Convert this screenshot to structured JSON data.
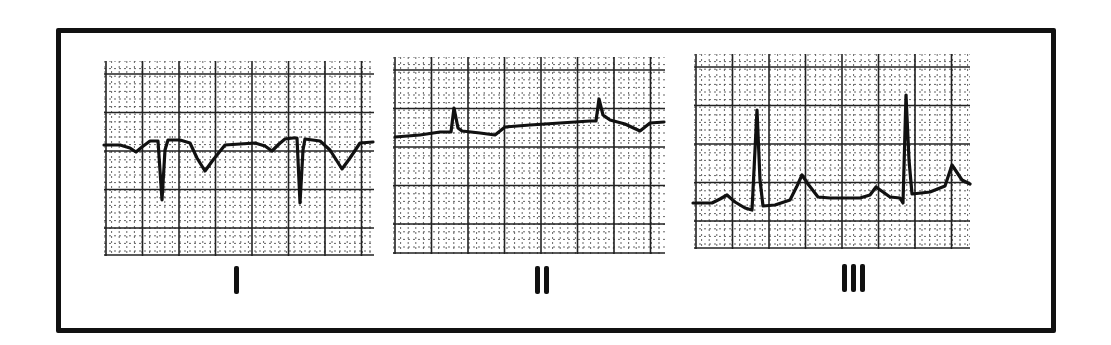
{
  "figure": {
    "type": "ECG strip comparison",
    "panels": [
      {
        "id": "I",
        "label": "I",
        "numeral_strokes": 1,
        "description": "Inverted P, deep negative QRS spikes, inverted T waves"
      },
      {
        "id": "II",
        "label": "II",
        "numeral_strokes": 2,
        "description": "Small positive QRS spikes on near-flat baseline"
      },
      {
        "id": "III",
        "label": "III",
        "numeral_strokes": 3,
        "description": "Upright P, tall positive QRS, upright T waves"
      }
    ]
  },
  "colors": {
    "ink": "#111111",
    "grid_major": "#222222",
    "grid_minor": "#555555",
    "paper": "#ffffff"
  },
  "chart_data": [
    {
      "type": "line",
      "title": "I",
      "xlabel": "",
      "ylabel": "",
      "grid": true,
      "x": [
        104,
        120,
        130,
        136,
        142,
        150,
        158,
        162,
        165,
        168,
        180,
        190,
        197,
        205,
        213,
        225,
        240,
        255,
        265,
        272,
        279,
        285,
        293,
        297,
        300,
        303,
        305,
        320,
        330,
        342,
        350,
        360,
        373
      ],
      "y": [
        145,
        145,
        148,
        152,
        147,
        141,
        141,
        200,
        150,
        140,
        140,
        143,
        158,
        171,
        160,
        145,
        144,
        143,
        146,
        151,
        144,
        139,
        138,
        138,
        203,
        150,
        139,
        141,
        150,
        169,
        158,
        143,
        142
      ]
    },
    {
      "type": "line",
      "title": "II",
      "xlabel": "",
      "ylabel": "",
      "grid": true,
      "x": [
        395,
        420,
        440,
        451,
        454,
        458,
        462,
        480,
        495,
        505,
        530,
        560,
        590,
        596,
        599,
        603,
        610,
        625,
        640,
        650,
        664
      ],
      "y": [
        137,
        135,
        132,
        132,
        108,
        128,
        131,
        133,
        135,
        127,
        125,
        123,
        121,
        121,
        99,
        115,
        120,
        124,
        131,
        123,
        122
      ],
      "note": "y values are pixel positions (smaller = higher)"
    },
    {
      "type": "line",
      "title": "III",
      "xlabel": "",
      "ylabel": "",
      "grid": true,
      "x": [
        693,
        712,
        720,
        727,
        735,
        745,
        752,
        755,
        757,
        760,
        763,
        775,
        790,
        797,
        802,
        808,
        818,
        830,
        860,
        870,
        876,
        883,
        890,
        900,
        903,
        906,
        909,
        912,
        930,
        945,
        952,
        962,
        970
      ],
      "y": [
        203,
        203,
        199,
        195,
        202,
        208,
        210,
        150,
        110,
        180,
        206,
        205,
        200,
        186,
        175,
        184,
        197,
        198,
        198,
        195,
        187,
        192,
        197,
        198,
        203,
        95,
        160,
        194,
        192,
        186,
        165,
        180,
        184
      ],
      "note": "y values are pixel positions (smaller = higher)"
    }
  ]
}
